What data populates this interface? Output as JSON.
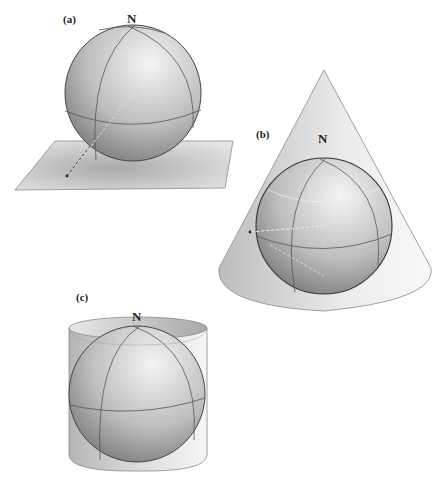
{
  "figure": {
    "panels": [
      {
        "id": "a",
        "label": "(a)",
        "pole_label": "N",
        "projection_surface": "plane"
      },
      {
        "id": "b",
        "label": "(b)",
        "pole_label": "N",
        "projection_surface": "cone"
      },
      {
        "id": "c",
        "label": "(c)",
        "pole_label": "N",
        "projection_surface": "cylinder"
      }
    ]
  },
  "colors": {
    "sphere_light": "#f2f2f2",
    "sphere_dark": "#7a7a7a",
    "surface_light": "#f4f4f4",
    "surface_dark": "#c6c6c6",
    "outline": "#555555"
  }
}
